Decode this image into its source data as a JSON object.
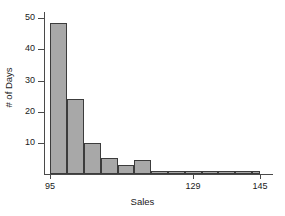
{
  "chart_data": {
    "type": "bar",
    "title": "",
    "subtitle": "",
    "xlabel": "Sales",
    "ylabel": "# of Days",
    "xlim": [
      93.5,
      148.0
    ],
    "ylim": [
      0,
      52
    ],
    "grid": false,
    "legend": null,
    "bin_width": 4,
    "bin_edges": [
      95,
      99,
      103,
      107,
      111,
      115,
      119,
      123,
      127,
      131,
      135,
      139,
      143,
      145
    ],
    "categories": [
      "95-99",
      "99-103",
      "103-107",
      "107-111",
      "111-115",
      "115-119",
      "119-123",
      "123-127",
      "127-131",
      "131-135",
      "135-139",
      "139-143",
      "143-145"
    ],
    "values": [
      48.5,
      24,
      10,
      5,
      3,
      4.5,
      1,
      1,
      1,
      1,
      1,
      1,
      1
    ],
    "bars": [
      {
        "x0": 95,
        "x1": 99,
        "value": 48.5
      },
      {
        "x0": 99,
        "x1": 103,
        "value": 24
      },
      {
        "x0": 103,
        "x1": 107,
        "value": 10
      },
      {
        "x0": 107,
        "x1": 111,
        "value": 5
      },
      {
        "x0": 111,
        "x1": 115,
        "value": 3
      },
      {
        "x0": 115,
        "x1": 119,
        "value": 4.5
      },
      {
        "x0": 119,
        "x1": 123,
        "value": 1
      },
      {
        "x0": 123,
        "x1": 127,
        "value": 1
      },
      {
        "x0": 127,
        "x1": 131,
        "value": 1
      },
      {
        "x0": 131,
        "x1": 135,
        "value": 1
      },
      {
        "x0": 135,
        "x1": 139,
        "value": 1
      },
      {
        "x0": 139,
        "x1": 143,
        "value": 1
      },
      {
        "x0": 143,
        "x1": 145,
        "value": 1
      }
    ],
    "yticks": [
      10,
      20,
      30,
      40,
      50
    ],
    "ytick_labels": [
      "10",
      "20",
      "30",
      "40",
      "50"
    ],
    "xticks": [
      95,
      129,
      145
    ],
    "xtick_labels": [
      "95",
      "129",
      "145"
    ],
    "colors": {
      "bar_fill": "#a8a8a8",
      "bar_edge": "#3c3c3c",
      "axis": "#4a4a4a",
      "text": "#1a1a1a",
      "background": "#ffffff"
    }
  }
}
